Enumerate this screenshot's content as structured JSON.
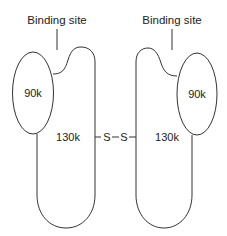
{
  "diagram": {
    "left_subunit": {
      "binding_site_label": "Binding site",
      "small_domain_label": "90k",
      "large_domain_label": "130k"
    },
    "right_subunit": {
      "binding_site_label": "Binding site",
      "small_domain_label": "90k",
      "large_domain_label": "130k"
    },
    "disulfide_bond": {
      "left_atom": "S",
      "right_atom": "S"
    },
    "colors": {
      "stroke": "#333333",
      "background": "#ffffff"
    }
  }
}
